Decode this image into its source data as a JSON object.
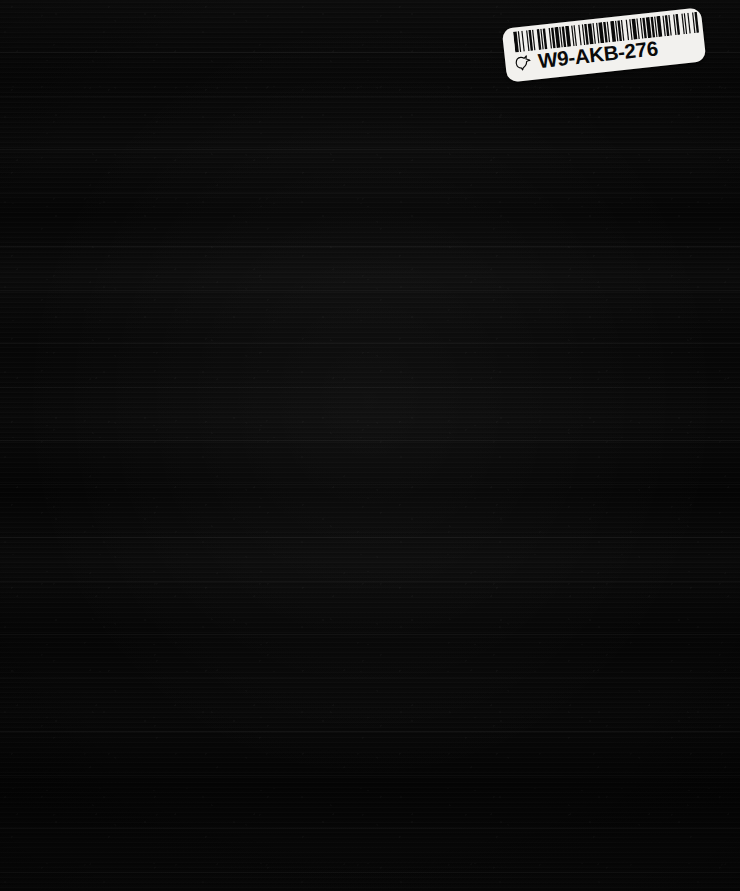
{
  "page": {
    "kind": "scanned-book-cover",
    "background_color": "#070707",
    "width": 740,
    "height": 891
  },
  "cover": {
    "description": "Plain dark near-black book cover scan with faint horizontal striations",
    "surface_color": "#080808"
  },
  "barcode_label": {
    "code": "W9-AKB-276",
    "label_color": "#f2f1ee",
    "ink_color": "#0a0a0a",
    "icon": "dove-icon",
    "rotation_degrees": -6.2,
    "barcode_type": "code-39",
    "bar_widths": [
      3,
      1,
      1,
      2,
      1,
      3,
      1,
      1,
      2,
      1,
      1,
      3,
      2,
      1,
      1,
      1,
      2,
      3,
      1,
      1,
      2,
      1,
      3,
      1,
      1,
      1,
      2,
      1,
      3,
      2,
      1,
      1,
      1,
      3,
      1,
      2,
      1,
      1,
      2,
      1,
      3,
      1,
      1,
      2,
      1,
      1,
      3,
      1,
      2,
      1,
      1,
      2,
      3,
      1,
      1,
      1,
      2,
      1,
      1,
      3,
      1,
      2,
      1,
      1,
      3,
      1,
      1,
      2,
      1,
      1,
      2,
      1,
      3,
      1,
      2,
      1,
      1,
      1,
      3,
      2,
      1,
      1,
      2,
      1,
      1,
      3,
      1,
      1,
      2,
      3,
      1,
      1,
      1,
      2,
      1,
      3,
      1,
      1,
      2,
      1
    ]
  }
}
